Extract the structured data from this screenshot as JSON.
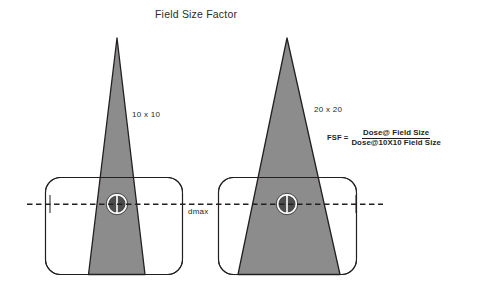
{
  "diagram": {
    "title": "Field Size Factor",
    "dmax_label": "dmax",
    "beams": [
      {
        "field_label": "10 x 10",
        "field_size": "10 x 10"
      },
      {
        "field_label": "20 x 20",
        "field_size": "20 x 20"
      }
    ],
    "formula": {
      "lhs": "FSF =",
      "numerator": "Dose@ Field Size",
      "denominator": "Dose@10X10 Field Size"
    },
    "colors": {
      "beam_fill": "#8c8c8c",
      "beam_stroke": "#231f20",
      "phantom_stroke": "#231f20",
      "axis_line": "#231f20",
      "chamber_fill": "#4d4d4d",
      "chamber_ring": "#ffffff",
      "text": "#231f20",
      "background": "#ffffff"
    },
    "icons": {
      "chamber": "ion-chamber-icon",
      "axis": "dmax-axis-icon"
    }
  }
}
